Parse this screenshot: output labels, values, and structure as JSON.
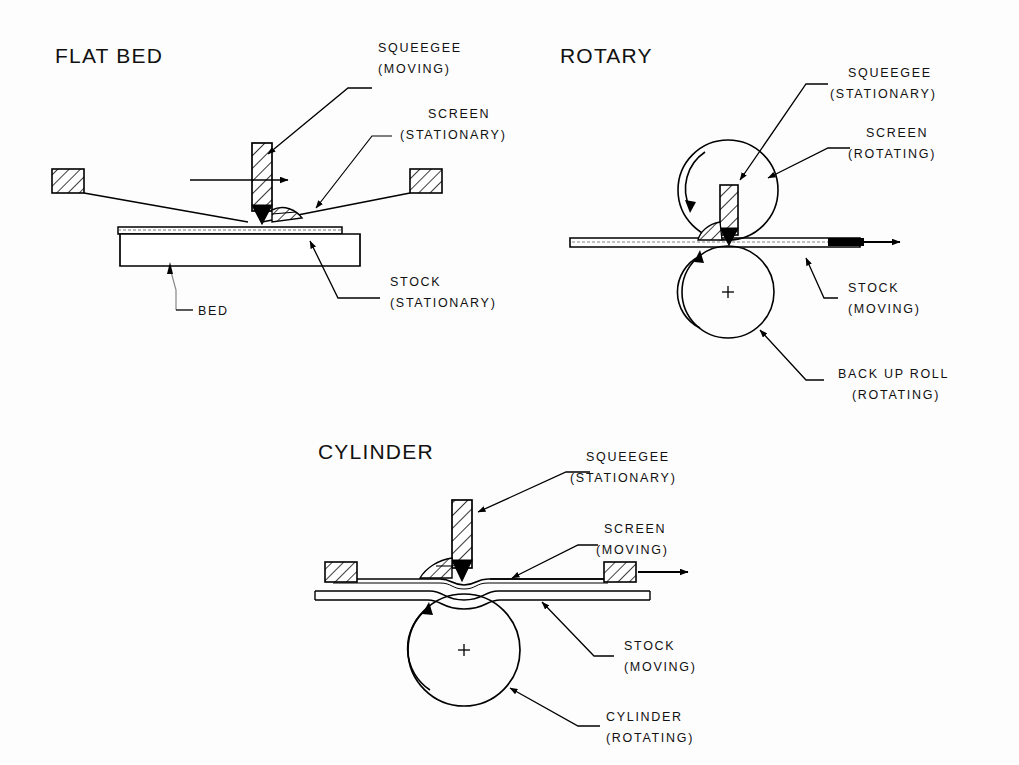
{
  "document": {
    "kind": "technical-diagram",
    "subject": "Screen printing methods comparison",
    "background_color": "#fdfdfd",
    "line_color": "#000000"
  },
  "diagrams": [
    {
      "id": "flat-bed",
      "title": "FLAT BED",
      "labels": [
        {
          "id": "squeegee",
          "line1": "SQUEEGEE",
          "line2": "(MOVING)"
        },
        {
          "id": "screen",
          "line1": "SCREEN",
          "line2": "(STATIONARY)"
        },
        {
          "id": "stock",
          "line1": "STOCK",
          "line2": "(STATIONARY)"
        },
        {
          "id": "bed",
          "line1": "BED",
          "line2": ""
        }
      ]
    },
    {
      "id": "rotary",
      "title": "ROTARY",
      "labels": [
        {
          "id": "squeegee",
          "line1": "SQUEEGEE",
          "line2": "(STATIONARY)"
        },
        {
          "id": "screen",
          "line1": "SCREEN",
          "line2": "(ROTATING)"
        },
        {
          "id": "stock",
          "line1": "STOCK",
          "line2": "(MOVING)"
        },
        {
          "id": "back-up-roll",
          "line1": "BACK UP ROLL",
          "line2": "(ROTATING)"
        }
      ]
    },
    {
      "id": "cylinder",
      "title": "CYLINDER",
      "labels": [
        {
          "id": "squeegee",
          "line1": "SQUEEGEE",
          "line2": "(STATIONARY)"
        },
        {
          "id": "screen",
          "line1": "SCREEN",
          "line2": "(MOVING)"
        },
        {
          "id": "stock",
          "line1": "STOCK",
          "line2": "(MOVING)"
        },
        {
          "id": "cylinder",
          "line1": "CYLINDER",
          "line2": "(ROTATING)"
        }
      ]
    }
  ],
  "text": {
    "flatbed_title": "FLAT BED",
    "flatbed_squeegee_1": "SQUEEGEE",
    "flatbed_squeegee_2": "(MOVING)",
    "flatbed_screen_1": "SCREEN",
    "flatbed_screen_2": "(STATIONARY)",
    "flatbed_stock_1": "STOCK",
    "flatbed_stock_2": "(STATIONARY)",
    "flatbed_bed": "BED",
    "rotary_title": "ROTARY",
    "rotary_squeegee_1": "SQUEEGEE",
    "rotary_squeegee_2": "(STATIONARY)",
    "rotary_screen_1": "SCREEN",
    "rotary_screen_2": "(ROTATING)",
    "rotary_stock_1": "STOCK",
    "rotary_stock_2": "(MOVING)",
    "rotary_backup_1": "BACK UP ROLL",
    "rotary_backup_2": "(ROTATING)",
    "cylinder_title": "CYLINDER",
    "cylinder_squeegee_1": "SQUEEGEE",
    "cylinder_squeegee_2": "(STATIONARY)",
    "cylinder_screen_1": "SCREEN",
    "cylinder_screen_2": "(MOVING)",
    "cylinder_stock_1": "STOCK",
    "cylinder_stock_2": "(MOVING)",
    "cylinder_cyl_1": "CYLINDER",
    "cylinder_cyl_2": "(ROTATING)"
  }
}
